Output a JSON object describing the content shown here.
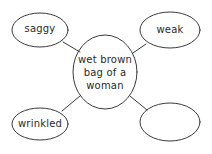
{
  "diagram": {
    "type": "word-web",
    "center": {
      "label": "wet brown bag of a woman",
      "lines": [
        "wet brown",
        "bag of a",
        "woman"
      ]
    },
    "nodes": [
      {
        "id": "top-left",
        "label": "saggy"
      },
      {
        "id": "top-right",
        "label": "weak"
      },
      {
        "id": "bottom-left",
        "label": "wrinkled"
      },
      {
        "id": "bottom-right",
        "label": ""
      }
    ],
    "colors": {
      "stroke": "#3a3a3a",
      "text": "#2a2a2a",
      "background": "#ffffff"
    }
  }
}
